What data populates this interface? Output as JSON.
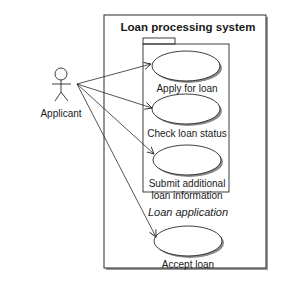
{
  "diagram": {
    "type": "uml-use-case",
    "system": {
      "title": "Loan processing system"
    },
    "package": {
      "label": "Loan application"
    },
    "actor": {
      "label": "Applicant"
    },
    "use_cases": [
      {
        "id": "apply",
        "lines": [
          "Apply for loan"
        ]
      },
      {
        "id": "check",
        "lines": [
          "Check loan status"
        ]
      },
      {
        "id": "submit",
        "lines": [
          "Submit additional",
          "loan information"
        ]
      },
      {
        "id": "accept",
        "lines": [
          "Accept loan"
        ]
      }
    ],
    "associations": [
      {
        "from": "Applicant",
        "to": "Apply for loan"
      },
      {
        "from": "Applicant",
        "to": "Check loan status"
      },
      {
        "from": "Applicant",
        "to": "Submit additional loan information"
      },
      {
        "from": "Applicant",
        "to": "Accept loan"
      }
    ],
    "colors": {
      "line": "#2a2a2a",
      "shadow": "#8a8a8a",
      "background": "#ffffff"
    }
  }
}
